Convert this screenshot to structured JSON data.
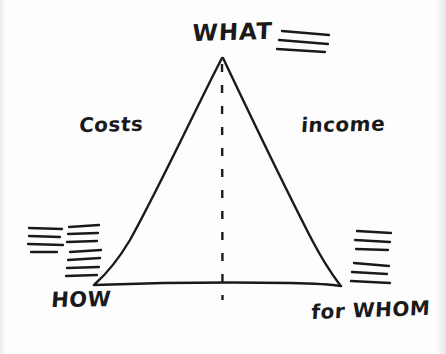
{
  "diagram": {
    "title_label": "WHAT",
    "left_side_label": "Costs",
    "right_side_label": "income",
    "bottom_left_label": "HOW",
    "bottom_right_label": "for WHOM",
    "shape": "triangle",
    "ink_color": "#1a1a1a",
    "background_color": "#fdfdfd",
    "vertices": {
      "apex": [
        222,
        57
      ],
      "bottom_left": [
        95,
        284
      ],
      "bottom_right": [
        340,
        285
      ]
    },
    "center_divider": {
      "style": "dashed",
      "from": [
        222,
        63
      ],
      "to": [
        222,
        300
      ]
    },
    "hatch_groups": [
      {
        "name": "hatch-top-right",
        "line_count": 3,
        "x": 281,
        "y": 31,
        "width": 48
      },
      {
        "name": "hatch-left-outer",
        "line_count": 4,
        "x": 27,
        "y": 228,
        "width": 38
      },
      {
        "name": "hatch-left-inner-upper",
        "line_count": 3,
        "x": 67,
        "y": 226,
        "width": 34
      },
      {
        "name": "hatch-left-inner-lower",
        "line_count": 4,
        "x": 66,
        "y": 250,
        "width": 38
      },
      {
        "name": "hatch-right-upper",
        "line_count": 3,
        "x": 355,
        "y": 230,
        "width": 36
      },
      {
        "name": "hatch-right-lower",
        "line_count": 3,
        "x": 352,
        "y": 262,
        "width": 38
      }
    ]
  }
}
